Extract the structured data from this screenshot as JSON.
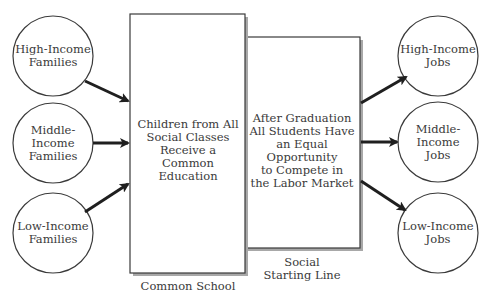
{
  "diagram": {
    "left_circles": [
      {
        "lines": [
          "High-Income",
          "Families"
        ]
      },
      {
        "lines": [
          "Middle-",
          "Income",
          "Families"
        ]
      },
      {
        "lines": [
          "Low-Income",
          "Families"
        ]
      }
    ],
    "right_circles": [
      {
        "lines": [
          "High-Income",
          "Jobs"
        ]
      },
      {
        "lines": [
          "Middle-",
          "Income",
          "Jobs"
        ]
      },
      {
        "lines": [
          "Low-Income",
          "Jobs"
        ]
      }
    ],
    "common_school_box": {
      "lines": [
        "Children from All",
        "Social Classes",
        "Receive a",
        "Common Education"
      ],
      "caption": "Common School"
    },
    "starting_line_box": {
      "lines": [
        "After Graduation",
        "All Students Have",
        "an Equal Opportunity",
        "to Compete in",
        "the Labor Market"
      ],
      "caption_lines": [
        "Social",
        "Starting Line"
      ]
    },
    "colors": {
      "stroke": "#3a3a3a",
      "arrow": "#1f1f1f",
      "shadow": "#9a9a9a",
      "background": "#ffffff"
    }
  }
}
